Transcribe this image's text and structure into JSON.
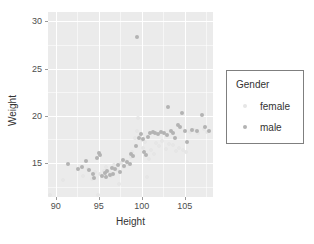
{
  "chart_data": {
    "type": "scatter",
    "title": "",
    "xlabel": "Height",
    "ylabel": "Weight",
    "xlim": [
      89.1,
      108.3
    ],
    "ylim": [
      11.4,
      31.0
    ],
    "xticks": [
      90,
      95,
      100,
      105
    ],
    "yticks": [
      15,
      20,
      25,
      30
    ],
    "xtick_labels": [
      "90",
      "95",
      "100",
      "105"
    ],
    "ytick_labels": [
      "15",
      "20",
      "25",
      "30"
    ],
    "grid": true,
    "legend": {
      "title": "Gender",
      "position": "right",
      "entries": [
        {
          "label": "female",
          "color": "#e6e6e6"
        },
        {
          "label": "male",
          "color": "#b3b3b3"
        }
      ]
    },
    "panel_background": "#ebebeb",
    "gridline_color": "#ffffff",
    "series": [
      {
        "name": "female",
        "color": "#e6e6e6",
        "points": [
          [
            89.3,
            11.6
          ],
          [
            90.9,
            13.2
          ],
          [
            93.2,
            13.6
          ],
          [
            93.8,
            14.4
          ],
          [
            94.2,
            13.3
          ],
          [
            94.6,
            14.1
          ],
          [
            94.9,
            11.6
          ],
          [
            95.2,
            13.8
          ],
          [
            95.6,
            14.2
          ],
          [
            95.9,
            14.6
          ],
          [
            96.2,
            14.0
          ],
          [
            96.4,
            13.6
          ],
          [
            96.8,
            14.8
          ],
          [
            97.1,
            14.3
          ],
          [
            97.4,
            12.8
          ],
          [
            97.6,
            15.0
          ],
          [
            97.9,
            14.6
          ],
          [
            98.2,
            15.2
          ],
          [
            98.4,
            14.9
          ],
          [
            98.7,
            15.6
          ],
          [
            98.9,
            16.2
          ],
          [
            99.2,
            17.6
          ],
          [
            99.4,
            18.4
          ],
          [
            99.6,
            19.8
          ],
          [
            99.8,
            17.9
          ],
          [
            100.0,
            17.4
          ],
          [
            100.2,
            16.6
          ],
          [
            100.4,
            17.2
          ],
          [
            100.6,
            13.5
          ],
          [
            100.8,
            15.4
          ],
          [
            101.1,
            16.4
          ],
          [
            101.4,
            16.0
          ],
          [
            101.7,
            17.1
          ],
          [
            102.0,
            16.8
          ],
          [
            102.4,
            17.3
          ],
          [
            102.8,
            16.5
          ],
          [
            103.2,
            17.0
          ],
          [
            103.6,
            16.9
          ],
          [
            104.0,
            16.3
          ],
          [
            104.4,
            16.6
          ],
          [
            104.8,
            16.4
          ],
          [
            105.2,
            16.2
          ],
          [
            105.6,
            18.3
          ],
          [
            106.1,
            18.5
          ],
          [
            106.6,
            18.2
          ],
          [
            107.2,
            18.6
          ],
          [
            107.6,
            18.3
          ]
        ]
      },
      {
        "name": "male",
        "color": "#b3b3b3",
        "points": [
          [
            91.4,
            14.9
          ],
          [
            92.6,
            14.4
          ],
          [
            93.0,
            14.6
          ],
          [
            93.5,
            15.2
          ],
          [
            93.9,
            14.3
          ],
          [
            94.3,
            13.8
          ],
          [
            94.5,
            13.4
          ],
          [
            94.8,
            15.5
          ],
          [
            95.0,
            16.1
          ],
          [
            95.2,
            15.9
          ],
          [
            95.4,
            13.6
          ],
          [
            95.7,
            13.9
          ],
          [
            95.9,
            13.5
          ],
          [
            96.0,
            14.2
          ],
          [
            96.3,
            13.7
          ],
          [
            96.5,
            14.5
          ],
          [
            96.7,
            13.8
          ],
          [
            96.9,
            14.4
          ],
          [
            97.2,
            14.8
          ],
          [
            97.5,
            14.1
          ],
          [
            97.8,
            15.3
          ],
          [
            98.0,
            14.7
          ],
          [
            98.3,
            15.1
          ],
          [
            98.6,
            14.9
          ],
          [
            98.8,
            16.0
          ],
          [
            99.0,
            15.7
          ],
          [
            99.3,
            16.8
          ],
          [
            99.5,
            28.3
          ],
          [
            99.7,
            17.7
          ],
          [
            99.9,
            18.1
          ],
          [
            100.1,
            17.5
          ],
          [
            100.3,
            16.2
          ],
          [
            100.5,
            15.8
          ],
          [
            100.7,
            17.8
          ],
          [
            101.0,
            18.2
          ],
          [
            101.3,
            18.3
          ],
          [
            101.6,
            18.2
          ],
          [
            101.9,
            18.1
          ],
          [
            102.2,
            18.3
          ],
          [
            102.6,
            18.2
          ],
          [
            102.9,
            18.0
          ],
          [
            103.1,
            20.9
          ],
          [
            103.4,
            18.4
          ],
          [
            103.7,
            18.2
          ],
          [
            103.9,
            17.6
          ],
          [
            104.2,
            19.0
          ],
          [
            104.5,
            18.8
          ],
          [
            104.7,
            20.3
          ],
          [
            105.0,
            18.4
          ],
          [
            105.3,
            17.2
          ],
          [
            105.9,
            18.5
          ],
          [
            106.4,
            18.4
          ],
          [
            107.0,
            20.1
          ],
          [
            107.4,
            18.8
          ],
          [
            107.8,
            18.4
          ],
          [
            108.5,
            30.5
          ]
        ]
      }
    ]
  }
}
